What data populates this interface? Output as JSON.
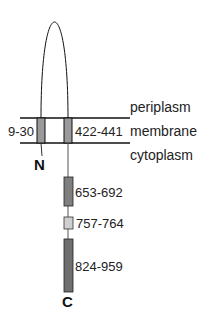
{
  "diagram": {
    "type": "membrane-protein-topology",
    "compartments": {
      "top": "periplasm",
      "middle": "membrane",
      "bottom": "cytoplasm"
    },
    "termini": {
      "n": "N",
      "c": "C"
    },
    "transmembrane_segments": [
      {
        "label": "9-30",
        "fill": "#9a9a9a"
      },
      {
        "label": "422-441",
        "fill": "#9a9a9a"
      }
    ],
    "cytoplasmic_domains": [
      {
        "label": "653-692",
        "fill": "#7f7f7f"
      },
      {
        "label": "757-764",
        "fill": "#cfcfcf"
      },
      {
        "label": "824-959",
        "fill": "#6f6f6f"
      }
    ],
    "colors": {
      "line": "#111111",
      "stem": "#555555"
    }
  }
}
